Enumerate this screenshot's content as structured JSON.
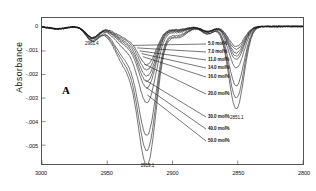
{
  "chart_data": {
    "type": "line",
    "title": "",
    "panel_label": "A",
    "xlabel": "",
    "ylabel": "Absorbance",
    "xlim": [
      3000,
      2800
    ],
    "ylim": [
      -0.0058,
      0.0004
    ],
    "x_ticks": [
      "3000",
      "2950",
      "2900",
      "2850",
      "2800"
    ],
    "x_tick_values": [
      3000,
      2950,
      2900,
      2850,
      2800
    ],
    "y_ticks": [
      "0",
      "-.001",
      "-.002",
      "-.003",
      "-.004",
      "-.005"
    ],
    "y_tick_values": [
      0,
      -0.001,
      -0.002,
      -0.003,
      -0.004,
      -0.005
    ],
    "grid": false,
    "legend_position": "inline-leader-lines",
    "peak_annotations": [
      {
        "label": "2961.4",
        "x": 2961.4,
        "y": -0.00042
      },
      {
        "label": "2919.1",
        "x": 2919.1,
        "y": -0.00555
      },
      {
        "label": "2851.1",
        "x": 2851.1,
        "y": -0.00352
      }
    ],
    "series": [
      {
        "name": "5.0 mol%",
        "label": "5.0 mol%",
        "peak_main": -0.00152,
        "peak_second": -0.00085
      },
      {
        "name": "7.0 mol%",
        "label": "7.0 mol%",
        "peak_main": -0.00172,
        "peak_second": -0.00097
      },
      {
        "name": "11.0 mol%",
        "label": "11.0 mol%",
        "peak_main": -0.00196,
        "peak_second": -0.00112
      },
      {
        "name": "14.0 mol%",
        "label": "14.0 mol%",
        "peak_main": -0.00218,
        "peak_second": -0.00126
      },
      {
        "name": "16.0 mol%",
        "label": "16.0 mol%",
        "peak_main": -0.00243,
        "peak_second": -0.0014
      },
      {
        "name": "20.0 mol%",
        "label": "20.0 mol%",
        "peak_main": -0.00302,
        "peak_second": -0.00176
      },
      {
        "name": "30.0 mol%",
        "label": "30.0 mol%",
        "peak_main": -0.00432,
        "peak_second": -0.00252
      },
      {
        "name": "40.0 mol%",
        "label": "40.0 mol%",
        "peak_main": -0.00492,
        "peak_second": -0.00304
      },
      {
        "name": "50.0 mol%",
        "label": "50.0 mol%",
        "peak_main": -0.00551,
        "peak_second": -0.0035
      }
    ],
    "colors": {
      "trace": "#1b1b1b",
      "axis": "#555555",
      "text": "#111111"
    }
  }
}
